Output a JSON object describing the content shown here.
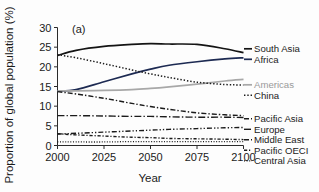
{
  "figure": {
    "panel_label": "(a)",
    "background_color": "#fdfdfd"
  },
  "chart_data": {
    "type": "line",
    "title": "",
    "subtitle": "",
    "xlabel": "Year",
    "ylabel": "Proportion of global population (%)",
    "xlim": [
      2000,
      2100
    ],
    "ylim": [
      0,
      30
    ],
    "xticks": [
      2000,
      2025,
      2050,
      2075,
      2100
    ],
    "yticks": [
      0,
      5,
      10,
      15,
      20,
      25,
      30
    ],
    "xtick_labels": [
      "2000",
      "2025",
      "2050",
      "2075",
      "2100"
    ],
    "ytick_labels": [
      "0",
      "5",
      "10",
      "15",
      "20",
      "25",
      "30"
    ],
    "grid": false,
    "legend_position": "right-outside",
    "x": [
      2000,
      2010,
      2025,
      2040,
      2050,
      2060,
      2075,
      2090,
      2100
    ],
    "series": [
      {
        "name": "South Asia",
        "color": "#141414",
        "style": "solid",
        "width": 1.7,
        "values": [
          22.9,
          24.2,
          25.2,
          25.7,
          25.9,
          25.8,
          25.7,
          24.6,
          23.6
        ]
      },
      {
        "name": "Africa",
        "color": "#1d2a52",
        "style": "solid",
        "width": 1.7,
        "values": [
          13.8,
          14.2,
          16.2,
          18.2,
          19.4,
          20.4,
          21.3,
          22.0,
          22.3
        ]
      },
      {
        "name": "Americas",
        "color": "#a8a8a8",
        "style": "solid",
        "width": 1.7,
        "values": [
          13.9,
          13.9,
          14.0,
          14.2,
          14.5,
          14.9,
          15.6,
          16.4,
          16.8
        ]
      },
      {
        "name": "China",
        "color": "#1b1b1b",
        "style": "dotted",
        "width": 1.5,
        "values": [
          23.1,
          22.3,
          20.8,
          19.2,
          18.2,
          17.3,
          16.1,
          15.5,
          15.4
        ]
      },
      {
        "name": "Pacific Asia",
        "color": "#1b1b1b",
        "style": "dashdot",
        "width": 1.4,
        "values": [
          13.7,
          13.1,
          12.0,
          10.7,
          9.9,
          9.2,
          8.3,
          7.8,
          7.6
        ]
      },
      {
        "name": "Europe",
        "color": "#1b1b1b",
        "style": "dashdot-long",
        "width": 1.4,
        "values": [
          7.6,
          7.6,
          7.5,
          7.4,
          7.4,
          7.3,
          7.2,
          7.2,
          7.1
        ]
      },
      {
        "name": "Middle East",
        "color": "#1b1b1b",
        "style": "dashdotdot",
        "width": 1.4,
        "values": [
          2.9,
          3.1,
          3.4,
          3.7,
          3.9,
          4.1,
          4.3,
          4.5,
          4.6
        ]
      },
      {
        "name": "Pacific OECI",
        "color": "#1b1b1b",
        "style": "dashdot-short",
        "width": 1.4,
        "values": [
          3.0,
          2.7,
          2.4,
          2.1,
          2.0,
          1.8,
          1.7,
          1.6,
          1.5
        ]
      },
      {
        "name": "Central Asia",
        "color": "#1b1b1b",
        "style": "dotted-fine",
        "width": 1.3,
        "values": [
          0.9,
          0.9,
          0.9,
          1.0,
          1.0,
          1.0,
          1.0,
          1.0,
          1.0
        ]
      }
    ]
  },
  "legend": {
    "groups": [
      {
        "entries": [
          {
            "label": "South Asia",
            "color": "#141414",
            "muted": false
          },
          {
            "label": "Africa",
            "color": "#1d2a52",
            "muted": false
          }
        ]
      },
      {
        "entries": [
          {
            "label": "Americas",
            "color": "#a8a8a8",
            "muted": true
          },
          {
            "label": "China",
            "color": "#1b1b1b",
            "muted": false
          }
        ]
      },
      {
        "entries": [
          {
            "label": "Pacific Asia",
            "color": "#1b1b1b",
            "muted": false
          },
          {
            "label": "Europe",
            "color": "#1b1b1b",
            "muted": false
          },
          {
            "label": "Middle East",
            "color": "#1b1b1b",
            "muted": false
          },
          {
            "label": "Pacific OECI",
            "color": "#1b1b1b",
            "muted": false
          },
          {
            "label": "Central Asia",
            "color": "#1b1b1b",
            "muted": false
          }
        ]
      }
    ]
  }
}
